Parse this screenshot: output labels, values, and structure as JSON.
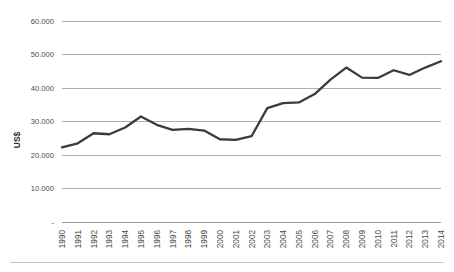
{
  "chart_data": {
    "type": "line",
    "title": "",
    "subtitle": "",
    "xlabel": "",
    "ylabel": "US$",
    "categories": [
      "1990",
      "1991",
      "1992",
      "1993",
      "1994",
      "1995",
      "1996",
      "1997",
      "1998",
      "1999",
      "2000",
      "2001",
      "2002",
      "2003",
      "2004",
      "2005",
      "2006",
      "2007",
      "2008",
      "2009",
      "2010",
      "2011",
      "2012",
      "2013",
      "2014"
    ],
    "series": [
      {
        "name": "US$",
        "values": [
          22300,
          23500,
          26500,
          26200,
          28200,
          31500,
          29000,
          27500,
          27800,
          27300,
          24700,
          24500,
          25600,
          34000,
          35500,
          35700,
          38200,
          42500,
          46100,
          43100,
          43000,
          45300,
          43900,
          46100,
          48000
        ]
      }
    ],
    "ylim": [
      0,
      60000
    ],
    "yticks": [
      0,
      10000,
      20000,
      30000,
      40000,
      50000,
      60000
    ],
    "ytick_labels": [
      "-",
      "10.000",
      "20.000",
      "30.000",
      "40.000",
      "50.000",
      "60.000"
    ],
    "grid": true,
    "legend": false,
    "legend_position": "none",
    "line_color": "#3b3b3b",
    "grid_color": "#9b9b9b",
    "text_color": "#4a4a4a",
    "background_color": "#ffffff"
  }
}
